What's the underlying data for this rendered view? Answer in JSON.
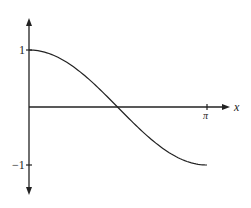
{
  "chart_data": {
    "type": "line",
    "title": "",
    "xlabel": "x",
    "ylabel": "",
    "function": "cos(x)",
    "x_range": [
      0,
      3.14159
    ],
    "ylim": [
      -1,
      1
    ],
    "x_ticks": [
      {
        "value": 3.14159,
        "label": "π"
      }
    ],
    "y_ticks": [
      {
        "value": 1,
        "label": "1"
      },
      {
        "value": -1,
        "label": "-1"
      }
    ],
    "grid": false,
    "legend": null,
    "series": [
      {
        "name": "cos x",
        "x": [
          0,
          0.3927,
          0.7854,
          1.1781,
          1.5708,
          1.9635,
          2.3562,
          2.7489,
          3.14159
        ],
        "values": [
          1,
          0.924,
          0.707,
          0.383,
          0,
          -0.383,
          -0.707,
          -0.924,
          -1
        ]
      }
    ]
  },
  "labels": {
    "x_axis": "x",
    "pi_tick": "π",
    "y_one": "1",
    "y_neg_one": "−1"
  },
  "colors": {
    "axis": "#222222",
    "curve": "#222222",
    "background": "#ffffff"
  }
}
